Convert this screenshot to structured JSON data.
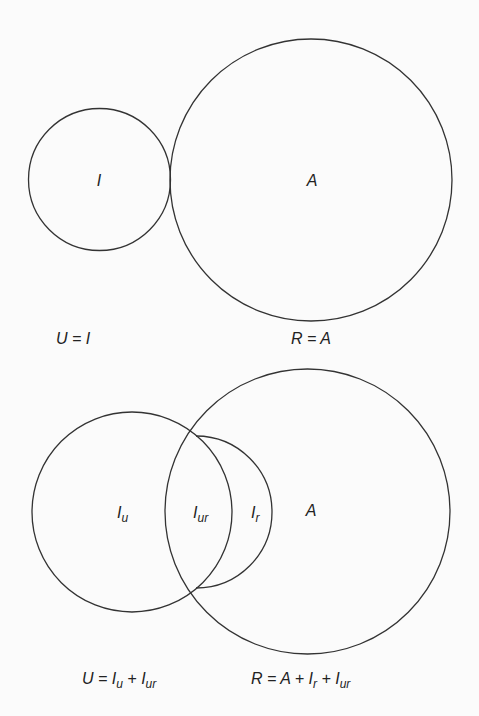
{
  "panels": [
    {
      "id": "disjoint",
      "circles": [
        {
          "name": "unreliable-circle",
          "cx": 99.5,
          "cy": 179.5,
          "r": 71,
          "label": "I",
          "label_x": 99,
          "label_y": 186
        },
        {
          "name": "reliable-circle",
          "cx": 311,
          "cy": 180,
          "r": 141,
          "label": "A",
          "label_x": 312,
          "label_y": 186
        }
      ],
      "formulas": {
        "left": {
          "main": "U = I",
          "x": 73,
          "y": 344
        },
        "right": {
          "main": "R = A",
          "x": 311,
          "y": 344
        }
      }
    },
    {
      "id": "overlapping",
      "circles": [
        {
          "name": "unreliable-circle",
          "cx": 132,
          "cy": 512,
          "r": 100
        },
        {
          "name": "reliable-circle",
          "cx": 307.5,
          "cy": 511.5,
          "r": 142.5
        },
        {
          "name": "retained-arc",
          "cx": 200,
          "cy": 512,
          "r": 76
        }
      ],
      "regions": [
        {
          "name": "region-iu",
          "base": "I",
          "sub": "u",
          "x": 117,
          "y": 518
        },
        {
          "name": "region-iur",
          "base": "I",
          "sub": "ur",
          "x": 193,
          "y": 518
        },
        {
          "name": "region-ir",
          "base": "I",
          "sub": "r",
          "x": 251,
          "y": 518
        },
        {
          "name": "region-a",
          "base": "A",
          "sub": "",
          "x": 311,
          "y": 516
        }
      ],
      "formulas": {
        "left": {
          "parts": [
            [
              "U = I",
              ""
            ],
            [
              "",
              "u"
            ],
            [
              " + I",
              ""
            ],
            [
              "",
              "ur"
            ]
          ],
          "text": "U = Iu + Iur"
        },
        "right": {
          "parts": [
            [
              "R = A + I",
              ""
            ],
            [
              "",
              "r"
            ],
            [
              " + I",
              ""
            ],
            [
              "",
              "ur"
            ]
          ],
          "text": "R = A + Ir + Iur"
        }
      }
    }
  ]
}
